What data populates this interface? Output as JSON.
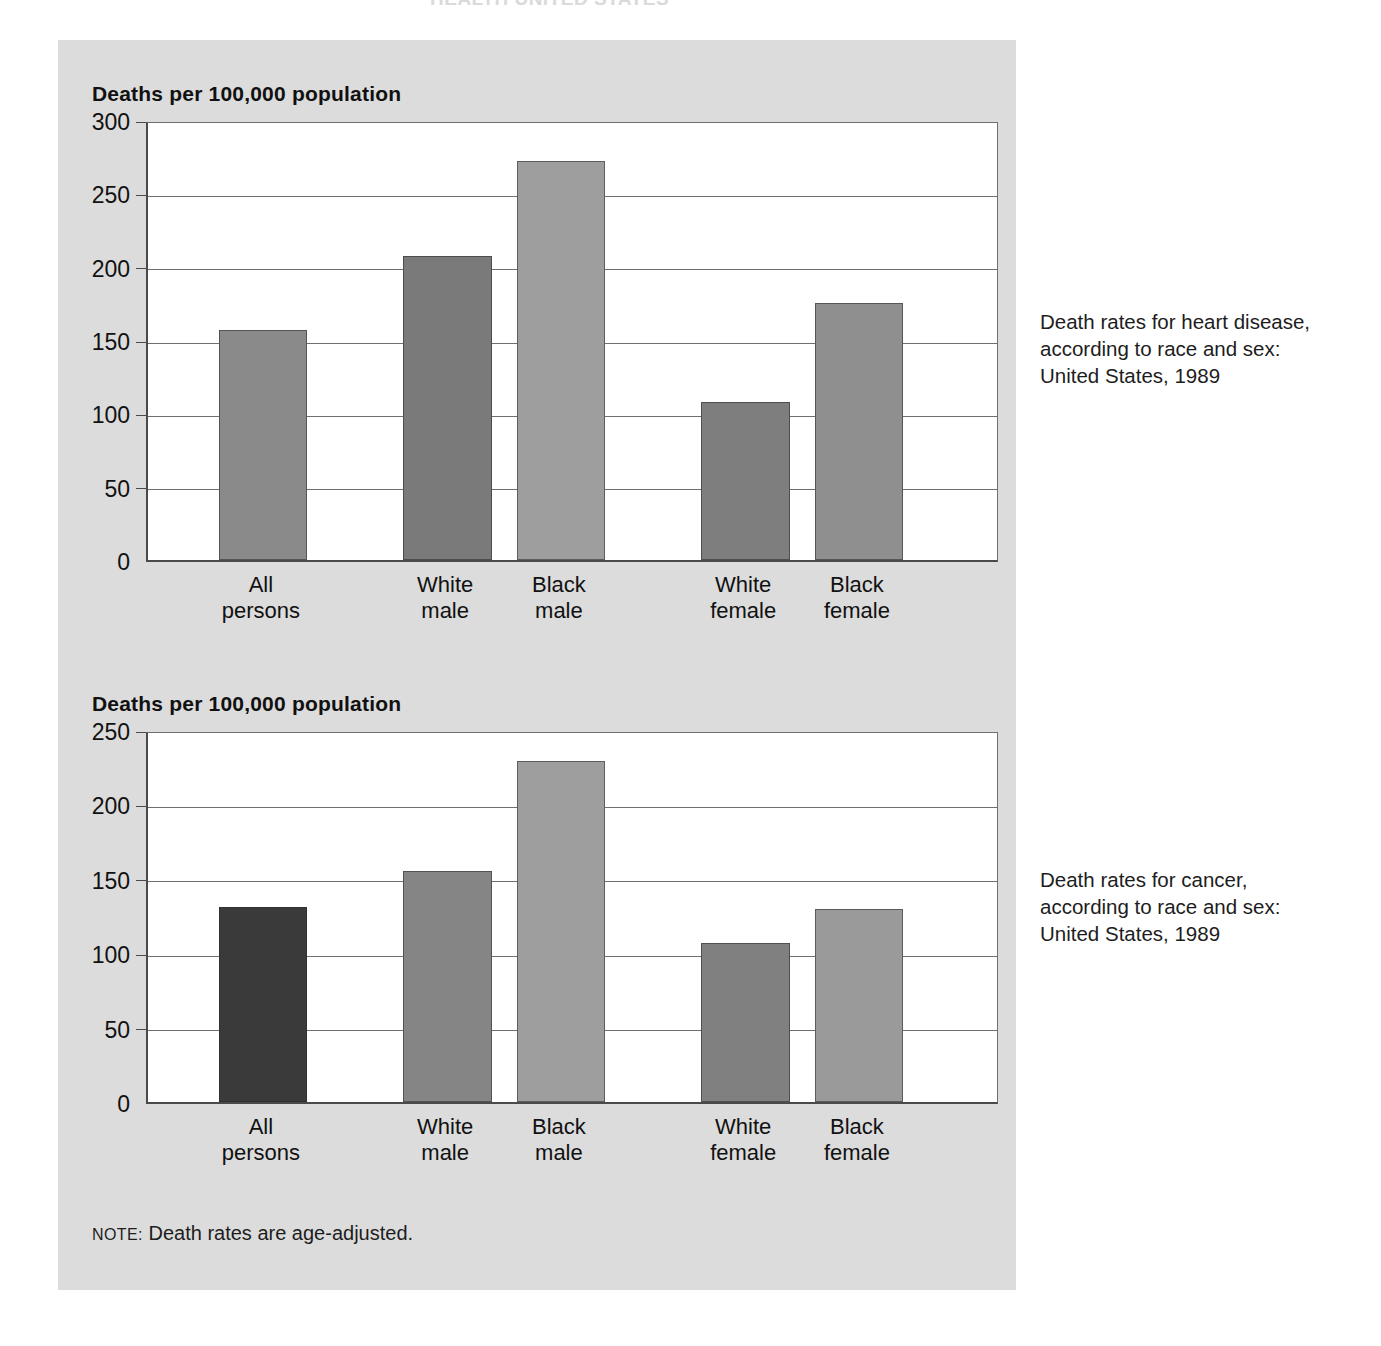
{
  "page": {
    "clipped_header_fragment": "HEALTH UNITED STATES",
    "panel_bg": "#dcdcdc",
    "note_keyword": "NOTE:",
    "note_text": "Death rates are age-adjusted."
  },
  "charts": [
    {
      "id": "heart-disease",
      "axis_title": "Deaths per 100,000 population",
      "caption": "Death rates for heart disease, according to race and sex: United States, 1989",
      "ylim": [
        0,
        300
      ],
      "yticks": [
        "0",
        "50",
        "100",
        "150",
        "200",
        "250",
        "300"
      ]
    },
    {
      "id": "cancer",
      "axis_title": "Deaths per 100,000 population",
      "caption": "Death rates for cancer, according to race and sex: United States, 1989",
      "ylim": [
        0,
        250
      ],
      "yticks": [
        "0",
        "50",
        "100",
        "150",
        "200",
        "250"
      ]
    }
  ],
  "chart_data": [
    {
      "type": "bar",
      "id": "heart-disease",
      "title": "Death rates for heart disease, according to race and sex: United States, 1989",
      "ylabel": "Deaths per 100,000 population",
      "xlabel": "",
      "ylim": [
        0,
        300
      ],
      "ytick_values": [
        0,
        50,
        100,
        150,
        200,
        250,
        300
      ],
      "grid": true,
      "legend": "none",
      "categories": [
        "All\npersons",
        "White\nmale",
        "Black\nmale",
        "White\nfemale",
        "Black\nfemale"
      ],
      "values": [
        157,
        207,
        272,
        108,
        175
      ],
      "colors": [
        "#8a8a8a",
        "#7a7a7a",
        "#9e9e9e",
        "#7e7e7e",
        "#8f8f8f"
      ],
      "group_gaps_after": [
        0,
        2
      ]
    },
    {
      "type": "bar",
      "id": "cancer",
      "title": "Death rates for cancer, according to race and sex: United States, 1989",
      "ylabel": "Deaths per 100,000 population",
      "xlabel": "",
      "ylim": [
        0,
        250
      ],
      "ytick_values": [
        0,
        50,
        100,
        150,
        200,
        250
      ],
      "grid": true,
      "legend": "none",
      "categories": [
        "All\npersons",
        "White\nmale",
        "Black\nmale",
        "White\nfemale",
        "Black\nfemale"
      ],
      "values": [
        131,
        155,
        229,
        107,
        130
      ],
      "colors": [
        "#3a3a3a",
        "#858585",
        "#9e9e9e",
        "#808080",
        "#9a9a9a"
      ],
      "group_gaps_after": [
        0,
        2
      ]
    }
  ]
}
